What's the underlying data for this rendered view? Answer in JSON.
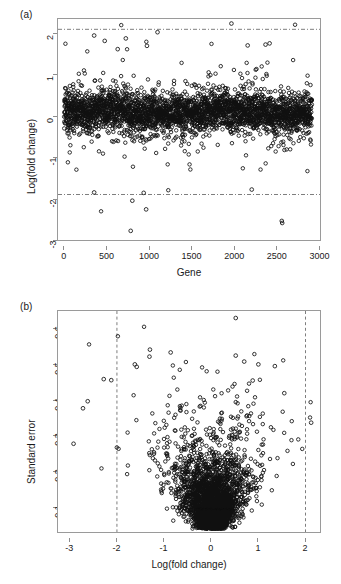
{
  "figure": {
    "background": "#ffffff",
    "marker_color": "#111111",
    "refline_color": "#6f6f6f",
    "frame_color": "#9a9a9a"
  },
  "panels": [
    {
      "tag": "(a)"
    },
    {
      "tag": "(b)"
    }
  ],
  "chart_data": [
    {
      "type": "scatter",
      "panel": "(a)",
      "title": "",
      "xlabel": "Gene",
      "ylabel": "Log(fold change)",
      "xlim": [
        -75,
        3175
      ],
      "ylim": [
        -3.15,
        2.25
      ],
      "xticks": [
        0,
        500,
        1000,
        1500,
        2000,
        2500,
        3000
      ],
      "xticklabels": [
        "0",
        "500",
        "1000",
        "1500",
        "2000",
        "2500",
        "3000"
      ],
      "yticks": [
        -3,
        -2,
        -1,
        0,
        1,
        2
      ],
      "yticklabels": [
        "-3",
        "-2",
        "-1",
        "0",
        "1",
        "2"
      ],
      "grid": false,
      "legend": null,
      "marker": "open-circle",
      "n_points": 3051,
      "annotations": [
        {
          "kind": "hline",
          "y": 2,
          "style": "dash-dot",
          "label": "upper fold-change threshold"
        },
        {
          "kind": "hline",
          "y": -2,
          "style": "dash-dot",
          "label": "lower fold-change threshold"
        }
      ],
      "summary": {
        "center": 0.02,
        "bulk_sd": 0.33,
        "note": "Log fold change per gene index; dense band about zero with scattered outliers beyond +/-2."
      },
      "notable_points": [
        {
          "x": 2060,
          "y": 2.14
        },
        {
          "x": 1150,
          "y": 1.93
        },
        {
          "x": 370,
          "y": 1.85
        },
        {
          "x": 760,
          "y": 1.78
        },
        {
          "x": 500,
          "y": 1.72
        },
        {
          "x": 2530,
          "y": 1.66
        },
        {
          "x": 2480,
          "y": 1.63
        },
        {
          "x": 2260,
          "y": 1.61
        },
        {
          "x": 1020,
          "y": 1.6
        },
        {
          "x": 660,
          "y": 1.52
        },
        {
          "x": 840,
          "y": -2.15
        },
        {
          "x": 1010,
          "y": -2.36
        },
        {
          "x": 820,
          "y": -2.88
        },
        {
          "x": 2680,
          "y": -2.64
        },
        {
          "x": 2685,
          "y": -2.69
        },
        {
          "x": 370,
          "y": -1.95
        },
        {
          "x": 980,
          "y": -1.96
        },
        {
          "x": 2310,
          "y": -1.88
        }
      ]
    },
    {
      "type": "scatter",
      "panel": "(b)",
      "title": "",
      "xlabel": "Log(fold change)",
      "ylabel": "Standard error",
      "xlim": [
        -3.25,
        2.35
      ],
      "ylim": [
        0.04,
        0.675
      ],
      "xticks": [
        -3,
        -2,
        -1,
        0,
        1,
        2
      ],
      "xticklabels": [
        "-3",
        "-2",
        "-1",
        "0",
        "1",
        "2"
      ],
      "yticks": [
        0.1,
        0.2,
        0.3,
        0.4,
        0.5,
        0.6
      ],
      "yticklabels": [
        "0.1",
        "0.2",
        "0.3",
        "0.4",
        "0.5",
        "0.6"
      ],
      "grid": false,
      "legend": null,
      "marker": "open-circle",
      "n_points": 3051,
      "annotations": [
        {
          "kind": "vline",
          "x": -2,
          "style": "dashed",
          "label": "lower fold-change threshold"
        },
        {
          "kind": "vline",
          "x": 2,
          "style": "dashed",
          "label": "upper fold-change threshold"
        }
      ],
      "summary": {
        "center_x": 0.02,
        "center_y": 0.15,
        "note": "Funnel/volcano shape: small standard errors concentrate near zero log fold change, larger errors fan outward."
      },
      "notable_points": [
        {
          "x": 0.52,
          "y": 0.655
        },
        {
          "x": -1.3,
          "y": 0.565
        },
        {
          "x": -1.31,
          "y": 0.545
        },
        {
          "x": -0.86,
          "y": 0.557
        },
        {
          "x": 0.52,
          "y": 0.548
        },
        {
          "x": 0.7,
          "y": 0.531
        },
        {
          "x": -1.62,
          "y": 0.523
        },
        {
          "x": -1.58,
          "y": 0.516
        },
        {
          "x": 1.0,
          "y": 0.523
        },
        {
          "x": 1.35,
          "y": 0.518
        },
        {
          "x": -2.92,
          "y": 0.297
        },
        {
          "x": -2.62,
          "y": 0.418
        },
        {
          "x": -2.72,
          "y": 0.398
        },
        {
          "x": -2.28,
          "y": 0.481
        },
        {
          "x": -2.12,
          "y": 0.478
        },
        {
          "x": 2.12,
          "y": 0.357
        },
        {
          "x": 1.55,
          "y": 0.441
        },
        {
          "x": 0.88,
          "y": 0.477
        }
      ]
    }
  ]
}
